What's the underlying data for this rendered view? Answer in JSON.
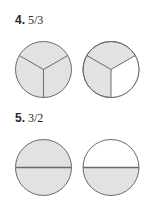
{
  "problems": [
    {
      "number": "4.",
      "fraction": "5/3",
      "circles": [
        {
          "divisions": 3,
          "shaded": 3
        },
        {
          "divisions": 3,
          "shaded": 2
        }
      ]
    },
    {
      "number": "5.",
      "fraction": "3/2",
      "circles": [
        {
          "divisions": 2,
          "shaded": 2
        },
        {
          "divisions": 2,
          "shaded": 1
        }
      ]
    }
  ],
  "colors": {
    "shade": "#e2e2e2",
    "outline": "#6a6a6a",
    "empty": "#ffffff"
  }
}
